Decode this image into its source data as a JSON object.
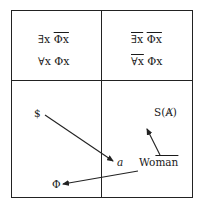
{
  "diagram": {
    "quadrants": {
      "top_left": {
        "line1": {
          "quantifier": "∃x",
          "quantifier_barred": false,
          "function": "Φx",
          "function_barred": true
        },
        "line2": {
          "quantifier": "∀x",
          "quantifier_barred": false,
          "function": "Φx",
          "function_barred": false
        }
      },
      "top_right": {
        "line1": {
          "quantifier": "∃x",
          "quantifier_barred": true,
          "function": "Φx",
          "function_barred": true
        },
        "line2": {
          "quantifier": "∀x",
          "quantifier_barred": true,
          "function": "Φx",
          "function_barred": false
        }
      },
      "bottom_left": {
        "barred_subject": "$",
        "phallus": "Φ"
      },
      "bottom_right": {
        "signifier_of_barred_other": "S(Ⱥ)",
        "object_a": "a",
        "woman_prefix": "Wo",
        "woman_barred": "man"
      }
    },
    "arrows": [
      {
        "from": "$",
        "to": "a"
      },
      {
        "from": "Woman",
        "to": "S(Ⱥ)"
      },
      {
        "from": "Woman",
        "to": "Φ"
      }
    ],
    "colors": {
      "line": "#222222",
      "text": "#1a1a1a",
      "background": "#ffffff"
    }
  }
}
